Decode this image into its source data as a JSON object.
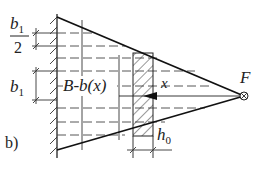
{
  "figure": {
    "panel_label": "b)",
    "labels": {
      "b1_half_num": "b",
      "b1_half_sub": "1",
      "b1_half_den": "2",
      "b1": "b",
      "b1_sub": "1",
      "width_expr": "B-b(x)",
      "x": "x",
      "force": "F",
      "h0": "h",
      "h0_sub": "0"
    },
    "colors": {
      "line": "#222222",
      "background": "#ffffff"
    }
  }
}
